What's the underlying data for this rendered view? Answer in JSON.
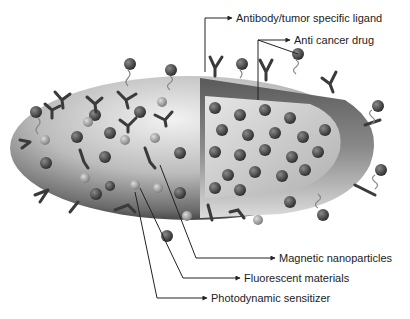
{
  "diagram": {
    "labels": {
      "antibody": "Antibody/tumor specific ligand",
      "drug": "Anti cancer drug",
      "magnetic": "Magnetic nanoparticles",
      "fluorescent": "Fluorescent materials",
      "photodynamic": "Photodynamic sensitizer"
    },
    "colors": {
      "shell_dark": "#3a3a3a",
      "shell_light": "#d8d8d8",
      "interior": "#c8c8c8",
      "cut_band": "#7a7a7a",
      "particle": "#4a4a4a",
      "line": "#333333"
    }
  }
}
